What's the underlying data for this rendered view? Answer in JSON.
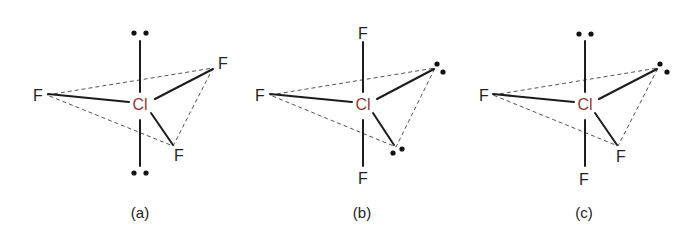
{
  "figure": {
    "central_atom": "Cl",
    "central_color": "#8a3a36",
    "panels": [
      {
        "id": "a",
        "caption": "(a)",
        "axial_top": "lone-pair",
        "axial_bottom": "lone-pair",
        "equatorial": [
          "F",
          "F",
          "F"
        ],
        "labels": {
          "left": "F",
          "upper_right": "F",
          "lower_right": "F"
        }
      },
      {
        "id": "b",
        "caption": "(b)",
        "axial_top": "F",
        "axial_bottom": "F",
        "equatorial": [
          "F",
          "lone-pair",
          "lone-pair"
        ],
        "labels": {
          "top": "F",
          "bottom": "F",
          "left": "F"
        }
      },
      {
        "id": "c",
        "caption": "(c)",
        "axial_top": "lone-pair",
        "axial_bottom": "F",
        "equatorial": [
          "F",
          "lone-pair",
          "F"
        ],
        "labels": {
          "bottom": "F",
          "left": "F",
          "lower_right": "F"
        }
      }
    ]
  }
}
